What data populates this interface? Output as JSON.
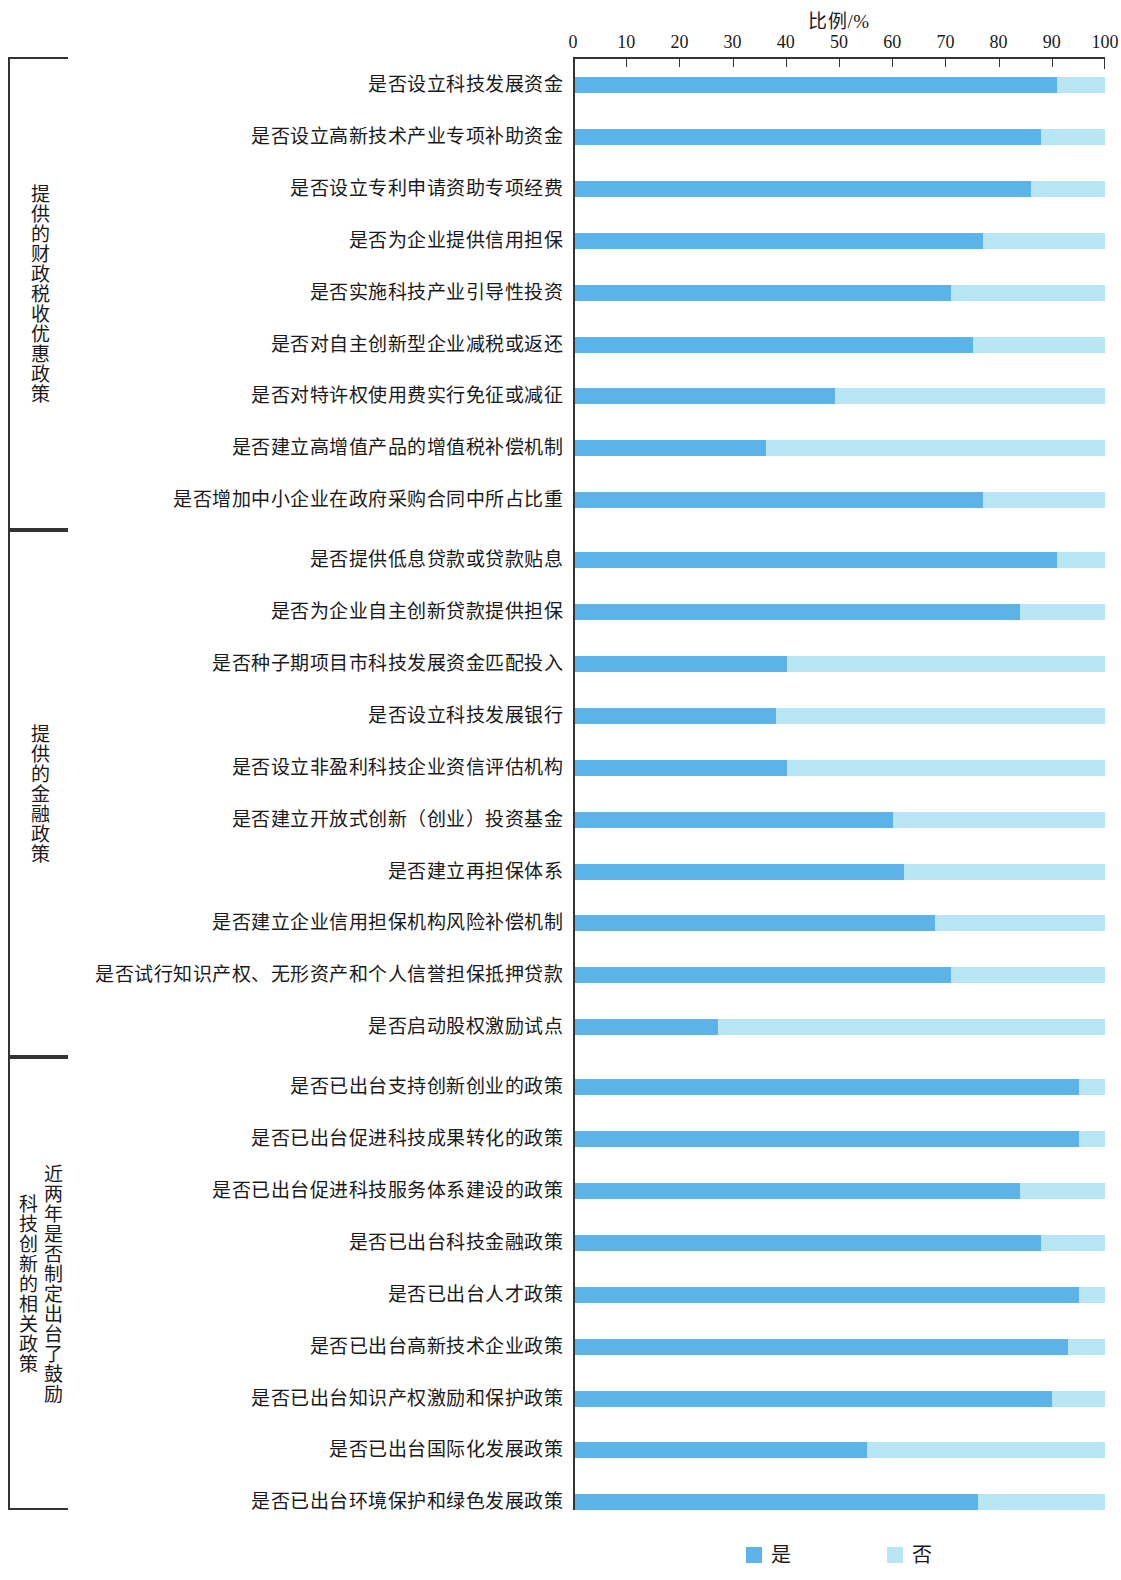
{
  "chart_data": {
    "type": "bar",
    "subtype": "stacked-horizontal-100",
    "title": "",
    "xlabel": "比例/%",
    "ylabel": "",
    "xlim": [
      0,
      100
    ],
    "xticks": [
      0,
      10,
      20,
      30,
      40,
      50,
      60,
      70,
      80,
      90,
      100
    ],
    "grid": false,
    "legend_position": "bottom-center",
    "legend": [
      "是",
      "否"
    ],
    "colors": {
      "yes": "#5BB3E8",
      "no": "#B9E6F5",
      "axis": "#333333",
      "text": "#1a1a1a"
    },
    "series": [
      {
        "name": "是",
        "values": [
          91,
          88,
          86,
          77,
          71,
          75,
          49,
          36,
          77,
          91,
          84,
          40,
          38,
          40,
          60,
          62,
          68,
          71,
          27,
          95,
          95,
          84,
          88,
          95,
          93,
          90,
          55,
          76
        ]
      },
      {
        "name": "否",
        "values": [
          9,
          12,
          14,
          23,
          29,
          25,
          51,
          64,
          23,
          9,
          16,
          60,
          62,
          60,
          40,
          38,
          32,
          29,
          73,
          5,
          5,
          16,
          12,
          5,
          7,
          10,
          45,
          24
        ]
      }
    ],
    "categories": [
      "是否设立科技发展资金",
      "是否设立高新技术产业专项补助资金",
      "是否设立专利申请资助专项经费",
      "是否为企业提供信用担保",
      "是否实施科技产业引导性投资",
      "是否对自主创新型企业减税或返还",
      "是否对特许权使用费实行免征或减征",
      "是否建立高增值产品的增值税补偿机制",
      "是否增加中小企业在政府采购合同中所占比重",
      "是否提供低息贷款或贷款贴息",
      "是否为企业自主创新贷款提供担保",
      "是否种子期项目市科技发展资金匹配投入",
      "是否设立科技发展银行",
      "是否设立非盈利科技企业资信评估机构",
      "是否建立开放式创新（创业）投资基金",
      "是否建立再担保体系",
      "是否建立企业信用担保机构风险补偿机制",
      "是否试行知识产权、无形资产和个人信誉担保抵押贷款",
      "是否启动股权激励试点",
      "是否已出台支持创新创业的政策",
      "是否已出台促进科技成果转化的政策",
      "是否已出台促进科技服务体系建设的政策",
      "是否已出台科技金融政策",
      "是否已出台人才政策",
      "是否已出台高新技术企业政策",
      "是否已出台知识产权激励和保护政策",
      "是否已出台国际化发展政策",
      "是否已出台环境保护和绿色发展政策"
    ],
    "groups": [
      {
        "label": "提供的财政税收优惠政策",
        "start": 0,
        "count": 9
      },
      {
        "label": "提供的金融政策",
        "start": 9,
        "count": 10
      },
      {
        "label": "近两年是否制定出台了鼓励\n科技创新的相关政策",
        "start": 19,
        "count": 9
      }
    ]
  }
}
